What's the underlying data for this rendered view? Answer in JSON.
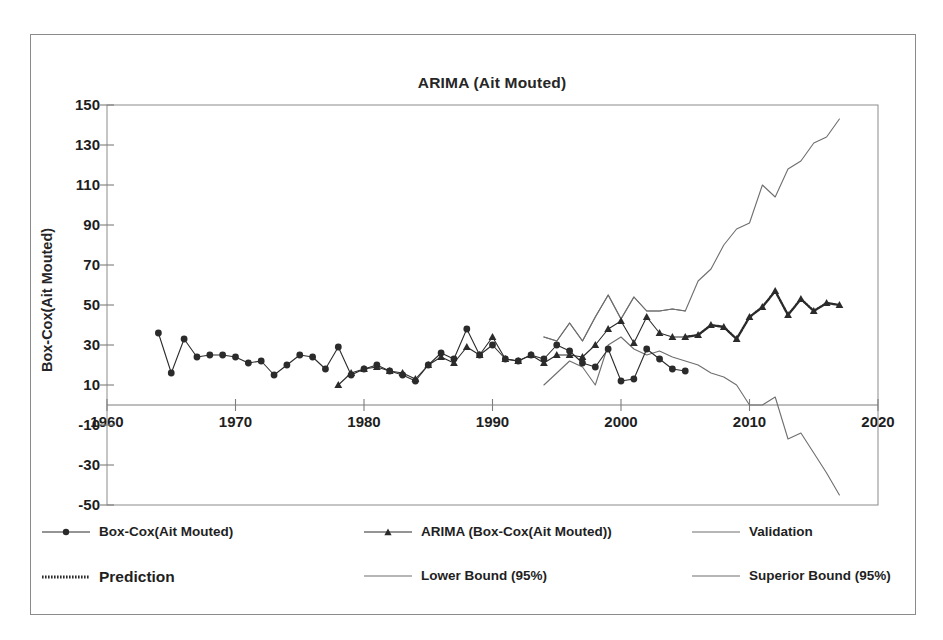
{
  "figure": {
    "title": "ARIMA (Ait Mouted)",
    "y_axis_title": "Box-Cox(Ait Mouted)"
  },
  "axes": {
    "y_ticks": [
      150,
      130,
      110,
      90,
      70,
      50,
      30,
      10,
      -10,
      -30,
      -50
    ],
    "x_ticks": [
      1960,
      1970,
      1980,
      1990,
      2000,
      2010,
      2020
    ]
  },
  "legend": {
    "row1": [
      {
        "label": "Box-Cox(Ait Mouted)",
        "marker": "circle",
        "style": "line-marker"
      },
      {
        "label": "ARIMA (Box-Cox(Ait Mouted))",
        "marker": "triangle",
        "style": "line-marker"
      },
      {
        "label": "Validation",
        "marker": "none",
        "style": "line"
      }
    ],
    "row2": [
      {
        "label": "Prediction",
        "marker": "none",
        "style": "dotted"
      },
      {
        "label": "Lower Bound (95%)",
        "marker": "none",
        "style": "line"
      },
      {
        "label": "Superior Bound (95%)",
        "marker": "none",
        "style": "line"
      }
    ]
  },
  "colors": {
    "line": "#2b2b2b",
    "bounds": "#6e6e6e",
    "axis": "#7d7d7d",
    "frame": "#8b8b8b",
    "text": "#1e1e1e"
  },
  "chart_data": {
    "type": "line",
    "title": "ARIMA (Ait Mouted)",
    "xlabel": "",
    "ylabel": "Box-Cox(Ait Mouted)",
    "xlim": [
      1960,
      2020
    ],
    "ylim": [
      -50,
      150
    ],
    "grid": false,
    "legend_position": "bottom",
    "yticks": [
      -50,
      -30,
      -10,
      10,
      30,
      50,
      70,
      90,
      110,
      130,
      150
    ],
    "xticks": [
      1960,
      1970,
      1980,
      1990,
      2000,
      2010,
      2020
    ],
    "series": [
      {
        "name": "Box-Cox(Ait Mouted)",
        "marker": "circle",
        "x": [
          1964,
          1965,
          1966,
          1967,
          1968,
          1969,
          1970,
          1971,
          1972,
          1973,
          1974,
          1975,
          1976,
          1977,
          1978,
          1979,
          1980,
          1981,
          1982,
          1983,
          1984,
          1985,
          1986,
          1987,
          1988,
          1989,
          1990,
          1991,
          1992,
          1993,
          1994,
          1995,
          1996,
          1997,
          1998,
          1999,
          2000,
          2001,
          2002,
          2003,
          2004,
          2005
        ],
        "values": [
          36,
          16,
          33,
          24,
          25,
          25,
          24,
          21,
          22,
          15,
          20,
          25,
          24,
          18,
          29,
          15,
          18,
          20,
          17,
          15,
          12,
          20,
          26,
          23,
          38,
          25,
          30,
          23,
          22,
          25,
          23,
          30,
          27,
          21,
          19,
          28,
          12,
          13,
          28,
          23,
          18,
          17
        ]
      },
      {
        "name": "ARIMA (Box-Cox(Ait Mouted))",
        "marker": "triangle",
        "x": [
          1978,
          1979,
          1980,
          1981,
          1982,
          1983,
          1984,
          1985,
          1986,
          1987,
          1988,
          1989,
          1990,
          1991,
          1992,
          1993,
          1994,
          1995,
          1996,
          1997,
          1998,
          1999,
          2000,
          2001,
          2002,
          2003,
          2004,
          2005,
          2006,
          2007,
          2008,
          2009,
          2010,
          2011,
          2012,
          2013,
          2014,
          2015,
          2016,
          2017
        ],
        "values": [
          10,
          16,
          18,
          19,
          17,
          16,
          13,
          20,
          24,
          21,
          29,
          25,
          34,
          23,
          22,
          25,
          21,
          25,
          25,
          24,
          30,
          38,
          42,
          31,
          44,
          36,
          34,
          34,
          35,
          40,
          39,
          33,
          44,
          49,
          57,
          45,
          53,
          47,
          51,
          50
        ]
      },
      {
        "name": "Validation",
        "marker": "none",
        "x": [
          1994,
          1995,
          1996,
          1997,
          1998,
          1999,
          2000,
          2001,
          2002,
          2003,
          2004,
          2005
        ],
        "values": [
          34,
          32,
          41,
          32,
          44,
          55,
          43,
          54,
          47,
          47,
          48,
          47
        ]
      },
      {
        "name": "Superior Bound (95%)",
        "marker": "none",
        "x": [
          1994,
          1995,
          1996,
          1997,
          1998,
          1999,
          2000,
          2001,
          2002,
          2003,
          2004,
          2005,
          2006,
          2007,
          2008,
          2009,
          2010,
          2011,
          2012,
          2013,
          2014,
          2015,
          2016,
          2017
        ],
        "values": [
          34,
          32,
          41,
          32,
          44,
          55,
          43,
          54,
          47,
          47,
          48,
          47,
          62,
          68,
          80,
          88,
          91,
          110,
          104,
          118,
          122,
          131,
          134,
          143
        ]
      },
      {
        "name": "Lower Bound (95%)",
        "marker": "none",
        "x": [
          1994,
          1995,
          1996,
          1997,
          1998,
          1999,
          2000,
          2001,
          2002,
          2003,
          2004,
          2005,
          2006,
          2007,
          2008,
          2009,
          2010,
          2011,
          2012,
          2013,
          2014,
          2015,
          2016,
          2017
        ],
        "values": [
          10,
          16,
          22,
          19,
          10,
          30,
          34,
          28,
          25,
          27,
          24,
          22,
          20,
          16,
          14,
          10,
          0,
          0,
          4,
          -17,
          -14,
          -24,
          -34,
          -45
        ]
      },
      {
        "name": "Prediction",
        "marker": "none",
        "x": [
          2005,
          2006,
          2007,
          2008,
          2009,
          2010,
          2011,
          2012,
          2013,
          2014,
          2015,
          2016,
          2017
        ],
        "values": [
          34,
          35,
          40,
          39,
          33,
          44,
          49,
          57,
          45,
          53,
          47,
          51,
          50
        ]
      }
    ]
  }
}
